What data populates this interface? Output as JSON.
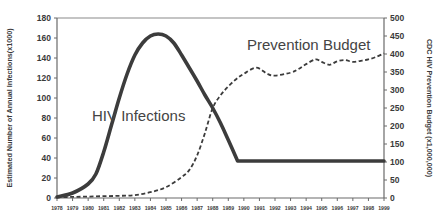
{
  "chart_data": {
    "type": "line",
    "title": "",
    "xlabel": "",
    "ylabel": "Estimated Number of Annual Infections(x1000)",
    "y2label": "CDC HIV Prevention Budget (x1,000,000)",
    "xlim": [
      1978,
      1999
    ],
    "ylim": [
      0,
      180
    ],
    "y2lim": [
      0,
      500
    ],
    "grid": false,
    "legend": "none (inline annotations)",
    "x_ticks": [
      "1978",
      "1979",
      "1980",
      "1981",
      "1982",
      "1983",
      "1984",
      "1985",
      "1986",
      "1987",
      "1988",
      "1989",
      "1990",
      "1991",
      "1992",
      "1993",
      "1994",
      "1995",
      "1996",
      "1997",
      "1998",
      "1999"
    ],
    "y_ticks": [
      "0",
      "20",
      "40",
      "60",
      "80",
      "100",
      "120",
      "140",
      "160",
      "180"
    ],
    "y2_ticks": [
      "0",
      "50",
      "100",
      "150",
      "200",
      "250",
      "300",
      "350",
      "400",
      "450",
      "500"
    ],
    "annotations": [
      {
        "text": "HIV Infections",
        "series": "HIV Infections"
      },
      {
        "text": "Prevention Budget",
        "series": "Prevention Budget"
      }
    ],
    "series": [
      {
        "name": "HIV Infections",
        "axis": "left",
        "style": "solid",
        "color": "#3c3c3c",
        "x": [
          1978,
          1979,
          1980,
          1980.5,
          1981,
          1981.5,
          1982,
          1982.5,
          1983,
          1983.5,
          1984,
          1984.5,
          1985,
          1985.5,
          1986,
          1986.5,
          1987,
          1987.5,
          1988,
          1988.5,
          1989,
          1989.6,
          1990,
          1991,
          1992,
          1993,
          1994,
          1995,
          1996,
          1997,
          1998,
          1999
        ],
        "values": [
          1,
          5,
          14,
          24,
          46,
          73,
          100,
          124,
          143,
          155,
          162,
          164,
          162,
          155,
          143,
          130,
          117,
          103,
          90,
          75,
          58,
          37,
          37,
          37,
          37,
          37,
          37,
          37,
          37,
          37,
          37,
          37
        ]
      },
      {
        "name": "Prevention Budget",
        "axis": "right",
        "style": "dashed",
        "color": "#3c3c3c",
        "x": [
          1978,
          1979,
          1980,
          1981,
          1982,
          1983,
          1984,
          1985,
          1986,
          1986.5,
          1987,
          1987.5,
          1988,
          1988.5,
          1989,
          1989.5,
          1990,
          1990.8,
          1991.5,
          1992,
          1993,
          1993.5,
          1994,
          1994.6,
          1995,
          1995.5,
          1996,
          1996.5,
          1997,
          1997.5,
          1998,
          1998.5,
          1999
        ],
        "values": [
          2,
          3,
          4,
          5,
          6,
          8,
          16,
          30,
          58,
          78,
          118,
          180,
          250,
          285,
          310,
          330,
          345,
          362,
          345,
          340,
          348,
          358,
          372,
          385,
          378,
          370,
          380,
          383,
          378,
          381,
          385,
          392,
          402
        ]
      }
    ]
  }
}
